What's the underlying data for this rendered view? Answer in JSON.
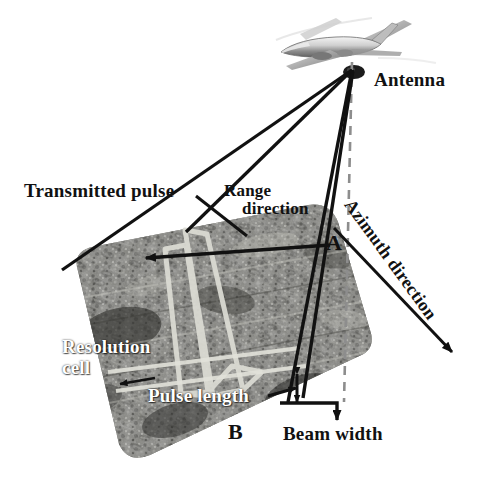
{
  "figure": {
    "background_color": "#ffffff",
    "width": 504,
    "height": 503
  },
  "labels": {
    "transmitted_pulse": "Transmitted pulse",
    "antenna": "Antenna",
    "range_direction_line1": "Range",
    "range_direction_line2": "direction",
    "azimuth_direction": "Azimuth direction",
    "point_a": "A",
    "point_b": "B",
    "resolution_cell_line1": "Resolution",
    "resolution_cell_line2": "cell",
    "pulse_length": "Pulse length",
    "beam_width": "Beam width"
  },
  "colors": {
    "line": "#111111",
    "label_dark": "#111111",
    "label_light": "#ffffff",
    "beam_footprint": "#d8d8d0",
    "terrain_light": "#b9b9b4",
    "terrain_dark": "#3a3a38",
    "nadir_dashed": "#8a8a8a"
  },
  "elements": {
    "aircraft": "airplane-photo",
    "nadir_line": "dashed-vertical-nadir-line",
    "terrain_patch": "radar-terrain-image-patch",
    "beam_footprint": "pulse-beam-footprint-outline",
    "range_arrow": "range-direction-arrow",
    "azimuth_arrow": "azimuth-direction-arrow",
    "beam_width_arrow": "beam-width-leader-arrow",
    "pulse_length_marker": "pulse-length-marker-lines"
  }
}
